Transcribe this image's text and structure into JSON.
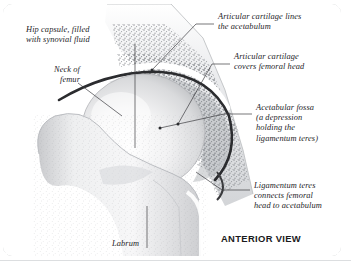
{
  "figure": {
    "view_label": "ANTERIOR VIEW",
    "background": "#ffffff",
    "border_color": "#c9cbcd",
    "ink_color": "#1d1d1f"
  },
  "labels": {
    "hip_capsule": "Hip capsule, filled\nwith synovial fluid",
    "neck_of_femur": "Neck of\nfemur",
    "articular_cartilage_acetabulum": "Articular cartilage lines\nthe acetabulum",
    "articular_cartilage_head": "Articular cartilage\ncovers femoral head",
    "acetabular_fossa": "Acetabular fossa\n(a depression\nholding the\nligamentum teres)",
    "ligamentum_teres": "Ligamentum teres\nconnects femoral\nhead to acetabulum",
    "labrum": "Labrum"
  },
  "structures": [
    {
      "name": "ilium",
      "description": "pelvic bone with trabecular stipple"
    },
    {
      "name": "acetabulum",
      "description": "socket of the hip joint"
    },
    {
      "name": "femoral-head",
      "description": "ball of the femur"
    },
    {
      "name": "femoral-neck",
      "description": "narrow segment below head"
    },
    {
      "name": "greater-trochanter",
      "description": "lateral bony prominence"
    },
    {
      "name": "femoral-shaft",
      "description": "body of the femur"
    },
    {
      "name": "joint-space",
      "description": "dark arc between head and socket"
    },
    {
      "name": "articular-cartilage",
      "description": "white band lining joint"
    },
    {
      "name": "labrum",
      "description": "rim of fibrocartilage"
    }
  ]
}
